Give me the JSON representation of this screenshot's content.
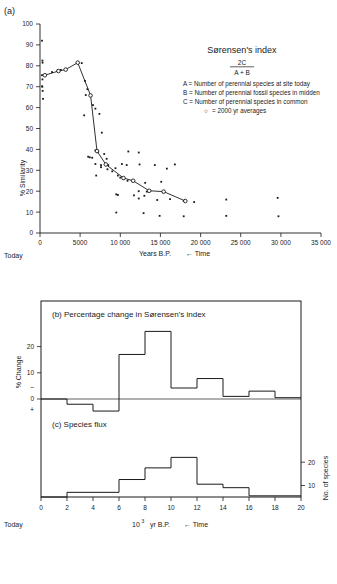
{
  "figure": {
    "panel_a_label": "(a)",
    "today_label_a": "Today",
    "today_label_c": "Today"
  },
  "legend": {
    "title": "Sørensen's index",
    "formula_numerator": "2C",
    "formula_denominator": "A + B",
    "lines": [
      "A = Number of perennial species at site today",
      "B = Number of perennial fossil species in midden",
      "C = Number of perennial species in common"
    ],
    "marker_note_symbol": "○",
    "marker_note": "= 2000 yr averages"
  },
  "panel_a": {
    "ylabel": "% Similarity",
    "xlabel_main": "Years B.P.",
    "xlabel_time": "← Time",
    "yticks": [
      0,
      10,
      20,
      30,
      40,
      50,
      60,
      70,
      80,
      90,
      100
    ],
    "xticks": [
      0,
      5000,
      10000,
      15000,
      20000,
      25000,
      30000,
      35000
    ],
    "xtick_labels": [
      "0",
      "5000",
      "10 000",
      "15 000",
      "20 000",
      "25 000",
      "30 000",
      "35 000"
    ],
    "ylim": [
      0,
      100
    ],
    "xlim": [
      0,
      35000
    ]
  },
  "panel_b": {
    "title": "(b) Percentage change in Sørensen's index",
    "ylabel": "% Change",
    "yticks": [
      0,
      10,
      20
    ],
    "ytick_labels": [
      "0",
      "10",
      "20"
    ],
    "sign_minus": "−",
    "sign_plus": "+",
    "ylim": [
      -6,
      28
    ]
  },
  "panel_c": {
    "title": "(c) Species flux",
    "ylabel_right": "No. of species",
    "yticks_right": [
      10,
      20
    ],
    "ytick_labels_right": [
      "10",
      "20"
    ],
    "ylim": [
      0,
      24
    ],
    "xlabel_main": "10",
    "xlabel_exp": "3",
    "xlabel_unit": " yr B.P.",
    "xlabel_time": "← Time",
    "xticks": [
      0,
      2,
      4,
      6,
      8,
      10,
      12,
      14,
      16,
      18,
      20
    ],
    "xtick_labels": [
      "0",
      "2",
      "4",
      "6",
      "8",
      "10",
      "12",
      "14",
      "16",
      "18",
      "20"
    ],
    "xlim": [
      0,
      20
    ]
  },
  "chart_data": [
    {
      "type": "scatter",
      "title": "(a) Sørensen's index vs age",
      "xlabel": "Years B.P.",
      "ylabel": "% Similarity",
      "xlim": [
        0,
        35000
      ],
      "ylim": [
        0,
        100
      ],
      "grid": false,
      "series": [
        {
          "name": "individual middens",
          "marker": "filled-square",
          "points": [
            [
              250,
              92.0
            ],
            [
              300,
              82.5
            ],
            [
              320,
              81.5
            ],
            [
              250,
              75.5
            ],
            [
              300,
              73.5
            ],
            [
              260,
              70.2
            ],
            [
              290,
              70.0
            ],
            [
              330,
              68.0
            ],
            [
              380,
              64.2
            ],
            [
              1500,
              77.0
            ],
            [
              2200,
              77.8
            ],
            [
              2600,
              78.0
            ],
            [
              3200,
              78.5
            ],
            [
              4600,
              81.5
            ],
            [
              5200,
              81.3
            ],
            [
              5600,
              72.8
            ],
            [
              5900,
              68.8
            ],
            [
              5700,
              66.0
            ],
            [
              5500,
              56.3
            ],
            [
              6600,
              61.2
            ],
            [
              6900,
              59.5
            ],
            [
              7400,
              57.0
            ],
            [
              7700,
              48.0
            ],
            [
              6900,
              39.5
            ],
            [
              7200,
              38.8
            ],
            [
              6000,
              36.5
            ],
            [
              6200,
              36.2
            ],
            [
              6500,
              36.0
            ],
            [
              6900,
              33.0
            ],
            [
              7600,
              32.5
            ],
            [
              8200,
              32.8
            ],
            [
              8500,
              32.5
            ],
            [
              8000,
              37.8
            ],
            [
              8300,
              35.5
            ],
            [
              7000,
              27.5
            ],
            [
              7600,
              31.5
            ],
            [
              8400,
              30.5
            ],
            [
              9000,
              29.5
            ],
            [
              9400,
              31.0
            ],
            [
              10200,
              33.0
            ],
            [
              11000,
              39.0
            ],
            [
              12300,
              38.5
            ],
            [
              10800,
              32.5
            ],
            [
              12400,
              32.8
            ],
            [
              14300,
              32.5
            ],
            [
              16800,
              32.8
            ],
            [
              9700,
              27.5
            ],
            [
              10000,
              26.5
            ],
            [
              10400,
              26.0
            ],
            [
              10900,
              25.0
            ],
            [
              15800,
              30.8
            ],
            [
              13100,
              24.0
            ],
            [
              15100,
              24.5
            ],
            [
              9500,
              18.5
            ],
            [
              9700,
              18.2
            ],
            [
              11700,
              18.0
            ],
            [
              13000,
              17.8
            ],
            [
              12300,
              16.5
            ],
            [
              14600,
              15.8
            ],
            [
              16200,
              16.2
            ],
            [
              12300,
              20.0
            ],
            [
              13300,
              19.8
            ],
            [
              15300,
              19.5
            ],
            [
              17900,
              15.3
            ],
            [
              19200,
              14.8
            ],
            [
              9500,
              9.8
            ],
            [
              12900,
              9.5
            ],
            [
              14900,
              8.2
            ],
            [
              17900,
              8.0
            ],
            [
              23200,
              8.2
            ],
            [
              23200,
              16.0
            ],
            [
              29700,
              8.0
            ],
            [
              29600,
              16.8
            ]
          ]
        },
        {
          "name": "2000 yr averages",
          "marker": "open-circle-line",
          "points": [
            [
              600,
              75.5
            ],
            [
              2300,
              77.5
            ],
            [
              3200,
              78.2
            ],
            [
              4700,
              81.5
            ],
            [
              6300,
              65.8
            ],
            [
              7100,
              39.2
            ],
            [
              8200,
              32.8
            ],
            [
              10400,
              26.3
            ],
            [
              11600,
              25.0
            ],
            [
              13600,
              20.2
            ],
            [
              15400,
              19.8
            ],
            [
              18100,
              15.3
            ]
          ]
        }
      ]
    },
    {
      "type": "bar",
      "title": "(b) Percentage change in Sørensen's index",
      "xlabel": "10³ yr B.P.",
      "ylabel": "% Change",
      "xlim": [
        0,
        20
      ],
      "ylim": [
        -6,
        28
      ],
      "grid": false,
      "bin_edges": [
        0,
        2,
        4,
        6,
        8,
        10,
        12,
        14,
        16,
        18,
        20
      ],
      "values": [
        0,
        -2.0,
        -4.6,
        17.0,
        25.8,
        4.2,
        7.8,
        1.0,
        3.0,
        0.5
      ]
    },
    {
      "type": "bar",
      "title": "(c) Species flux",
      "xlabel": "10³ yr B.P.",
      "ylabel": "No. of species",
      "xlim": [
        0,
        20
      ],
      "ylim": [
        0,
        24
      ],
      "grid": false,
      "bin_edges": [
        0,
        2,
        4,
        6,
        8,
        10,
        12,
        14,
        16,
        18,
        20
      ],
      "values": [
        0,
        2.0,
        2.0,
        7.5,
        12.5,
        17.0,
        5.5,
        4.0,
        0.5,
        0.5
      ]
    }
  ]
}
